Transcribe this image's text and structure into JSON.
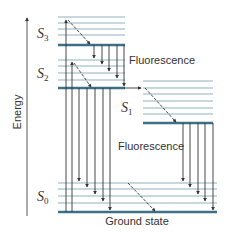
{
  "diagram": {
    "axis_label": "Energy",
    "colors": {
      "thin_level": "#8fb4bf",
      "thick_level": "#3d6f86",
      "arrow": "#333333",
      "text": "#333333"
    },
    "states": [
      {
        "id": "S3",
        "symbol": "S",
        "subscript": "3"
      },
      {
        "id": "S2",
        "symbol": "S",
        "subscript": "2"
      },
      {
        "id": "S1",
        "symbol": "S",
        "subscript": "1"
      },
      {
        "id": "S0",
        "symbol": "S",
        "subscript": "0"
      }
    ],
    "labels": {
      "fluorescence_upper": "Fluorescence",
      "fluorescence_lower": "Fluorescence",
      "ground_state": "Ground state"
    }
  }
}
